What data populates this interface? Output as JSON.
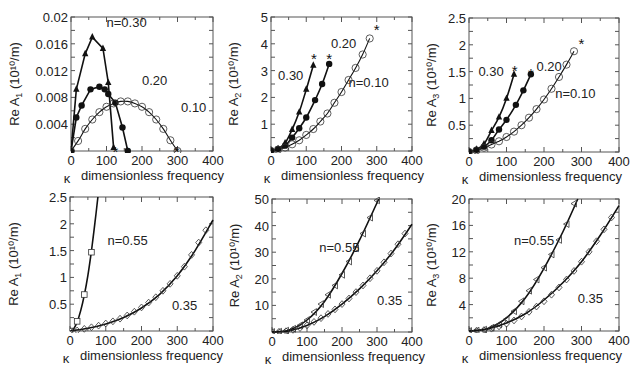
{
  "figure": {
    "xlabel": "dimensionless frequency",
    "kappa_symbol": "κ",
    "y_unit": "(10¹⁰/m)"
  },
  "chart_data": [
    {
      "type": "line",
      "panel": "top-left",
      "ylabel": "Re A1 (10^10/m)",
      "ylabel_main": "Re A",
      "ylabel_sub": "1",
      "xlabel": "κ dimensionless frequency",
      "xlim": [
        0,
        400
      ],
      "ylim": [
        0,
        0.02
      ],
      "xticks": [
        0,
        100,
        200,
        300,
        400
      ],
      "yticks": [
        0.004,
        0.008,
        0.012,
        0.016,
        0.02
      ],
      "ytick_labels": [
        "0.004",
        "0.008",
        "0.012",
        "0.016",
        "0.02"
      ],
      "series": [
        {
          "name": "n=0.30",
          "marker": "filled-triangle",
          "x": [
            0,
            15,
            40,
            60,
            90,
            105,
            120
          ],
          "y": [
            0,
            0.0092,
            0.0145,
            0.017,
            0.0153,
            0.0102,
            0.0005
          ],
          "end_marker": "asterisk",
          "end_x": 125
        },
        {
          "name": "0.20",
          "marker": "filled-circle",
          "x": [
            0,
            15,
            30,
            55,
            80,
            95,
            105,
            125,
            145,
            160
          ],
          "y": [
            0,
            0.005,
            0.0068,
            0.0092,
            0.0096,
            0.0092,
            0.0085,
            0.0072,
            0.0035,
            0
          ],
          "end_marker": "asterisk",
          "end_x": 158
        },
        {
          "name": "0.10",
          "marker": "open-circle",
          "x": [
            0,
            20,
            40,
            60,
            80,
            100,
            120,
            140,
            160,
            180,
            200,
            220,
            240,
            260,
            280,
            300
          ],
          "y": [
            0,
            0.0015,
            0.0033,
            0.0047,
            0.0058,
            0.0066,
            0.0071,
            0.0074,
            0.0074,
            0.0071,
            0.0066,
            0.0058,
            0.0047,
            0.0033,
            0.0016,
            0
          ],
          "end_marker": "asterisk",
          "end_x": 298
        }
      ],
      "annotations": [
        {
          "text": "n=0.30",
          "x": 100,
          "y": 0.0185
        },
        {
          "text": "0.20",
          "x": 200,
          "y": 0.0098
        },
        {
          "text": "0.10",
          "x": 310,
          "y": 0.0058
        }
      ]
    },
    {
      "type": "line",
      "panel": "top-middle",
      "ylabel": "Re A2 (10^10/m)",
      "ylabel_main": "Re A",
      "ylabel_sub": "2",
      "xlabel": "κ dimensionless frequency",
      "xlim": [
        0,
        400
      ],
      "ylim": [
        0,
        5
      ],
      "xticks": [
        0,
        100,
        200,
        300,
        400
      ],
      "yticks": [
        1,
        2,
        3,
        4,
        5
      ],
      "ytick_labels": [
        "1",
        "2",
        "3",
        "4",
        "5"
      ],
      "series": [
        {
          "name": "0.30",
          "marker": "filled-triangle",
          "x": [
            0,
            20,
            40,
            60,
            80,
            100,
            120
          ],
          "y": [
            0.02,
            0.08,
            0.3,
            0.8,
            1.45,
            2.3,
            3.2
          ],
          "end_marker": "asterisk",
          "end_x": 122,
          "end_y": 3.5
        },
        {
          "name": "0.20",
          "marker": "filled-circle",
          "x": [
            0,
            20,
            40,
            60,
            80,
            100,
            125,
            145,
            165
          ],
          "y": [
            0.02,
            0.08,
            0.2,
            0.5,
            0.85,
            1.25,
            1.9,
            2.5,
            3.25
          ],
          "end_marker": "asterisk",
          "end_x": 165,
          "end_y": 3.5
        },
        {
          "name": "n=0.10",
          "marker": "open-circle",
          "x": [
            0,
            20,
            40,
            60,
            80,
            100,
            120,
            140,
            160,
            180,
            200,
            220,
            240,
            260,
            280
          ],
          "y": [
            0,
            0.05,
            0.13,
            0.25,
            0.4,
            0.6,
            0.82,
            1.1,
            1.4,
            1.8,
            2.2,
            2.65,
            3.1,
            3.6,
            4.2
          ],
          "end_marker": "asterisk",
          "end_x": 300,
          "end_y": 4.6
        }
      ],
      "annotations": [
        {
          "text": "0.20",
          "x": 170,
          "y": 3.85
        },
        {
          "text": "0.30",
          "x": 20,
          "y": 2.65
        },
        {
          "text": "n=0.10",
          "x": 220,
          "y": 2.4
        }
      ]
    },
    {
      "type": "line",
      "panel": "top-right",
      "ylabel": "Re A3 (10^10/m)",
      "ylabel_main": "Re A",
      "ylabel_sub": "3",
      "xlabel": "κ dimensionless frequency",
      "xlim": [
        0,
        400
      ],
      "ylim": [
        0,
        2.5
      ],
      "xticks": [
        0,
        100,
        200,
        300,
        400
      ],
      "yticks": [
        0.5,
        1,
        1.5,
        2,
        2.5
      ],
      "ytick_labels": [
        "0.5",
        "1",
        "1.5",
        "2",
        "2.5"
      ],
      "series": [
        {
          "name": "0.30",
          "marker": "filled-triangle",
          "x": [
            0,
            20,
            40,
            60,
            80,
            100,
            120
          ],
          "y": [
            0.01,
            0.05,
            0.15,
            0.4,
            0.65,
            1.0,
            1.45
          ],
          "end_marker": "asterisk",
          "end_x": 122,
          "end_y": 1.55
        },
        {
          "name": "0.20",
          "marker": "filled-circle",
          "x": [
            0,
            20,
            40,
            60,
            80,
            100,
            125,
            145,
            165
          ],
          "y": [
            0.01,
            0.04,
            0.1,
            0.22,
            0.42,
            0.6,
            0.88,
            1.15,
            1.45
          ],
          "end_marker": "asterisk",
          "end_x": 165,
          "end_y": 1.5
        },
        {
          "name": "n=0.10",
          "marker": "open-circle",
          "x": [
            0,
            20,
            40,
            60,
            80,
            100,
            120,
            140,
            160,
            180,
            200,
            220,
            240,
            260,
            280
          ],
          "y": [
            0,
            0.03,
            0.08,
            0.14,
            0.2,
            0.28,
            0.38,
            0.5,
            0.64,
            0.8,
            0.98,
            1.18,
            1.4,
            1.63,
            1.88
          ],
          "end_marker": "asterisk",
          "end_x": 300,
          "end_y": 2.05
        }
      ],
      "annotations": [
        {
          "text": "0.30",
          "x": 25,
          "y": 1.42
        },
        {
          "text": "0.20",
          "x": 180,
          "y": 1.52
        },
        {
          "text": "n=0.10",
          "x": 230,
          "y": 1.0
        }
      ]
    },
    {
      "type": "line",
      "panel": "bottom-left",
      "ylabel": "Re A1 (10^10/m)",
      "ylabel_main": "Re A",
      "ylabel_sub": "1",
      "xlabel": "κ dimensionless frequency",
      "xlim": [
        0,
        400
      ],
      "ylim": [
        0,
        2.5
      ],
      "xticks": [
        0,
        100,
        200,
        300,
        400
      ],
      "yticks": [
        0.5,
        1,
        1.5,
        2,
        2.5
      ],
      "ytick_labels": [
        "0.5",
        "1",
        "1.5",
        "2",
        "2.5"
      ],
      "series": [
        {
          "name": "n=0.55",
          "marker": "open-square",
          "x": [
            0,
            20,
            40,
            60
          ],
          "y": [
            0,
            0.18,
            0.68,
            1.47
          ],
          "curve_x": [
            0,
            10,
            20,
            30,
            40,
            50,
            60,
            70,
            78
          ],
          "curve_y": [
            0,
            0.04,
            0.17,
            0.38,
            0.67,
            1.04,
            1.5,
            2.03,
            2.5
          ]
        },
        {
          "name": "0.35",
          "marker": "open-diamond",
          "x": [
            0,
            20,
            40,
            60,
            80,
            100,
            120,
            140,
            160,
            180,
            200,
            220,
            240,
            260,
            280,
            300,
            320,
            340,
            360,
            380
          ],
          "y": [
            0,
            0.01,
            0.04,
            0.07,
            0.1,
            0.14,
            0.18,
            0.23,
            0.29,
            0.36,
            0.44,
            0.53,
            0.63,
            0.75,
            0.88,
            1.03,
            1.2,
            1.42,
            1.65,
            1.88
          ],
          "curve_x": [
            0,
            50,
            100,
            150,
            200,
            250,
            300,
            350,
            400
          ],
          "curve_y": [
            0,
            0.05,
            0.13,
            0.25,
            0.43,
            0.68,
            1.03,
            1.5,
            2.07
          ]
        }
      ],
      "annotations": [
        {
          "text": "n=0.55",
          "x": 105,
          "y": 1.6
        },
        {
          "text": "0.35",
          "x": 285,
          "y": 0.4
        }
      ]
    },
    {
      "type": "line",
      "panel": "bottom-middle",
      "ylabel": "Re A2 (10^10/m)",
      "ylabel_main": "Re A",
      "ylabel_sub": "2",
      "xlabel": "κ dimensionless frequency",
      "xlim": [
        0,
        400
      ],
      "ylim": [
        0,
        50
      ],
      "xticks": [
        0,
        100,
        200,
        300,
        400
      ],
      "yticks": [
        10,
        20,
        30,
        40,
        50
      ],
      "ytick_labels": [
        "10",
        "20",
        "30",
        "40",
        "50"
      ],
      "series": [
        {
          "name": "n=0.55",
          "marker": "open-left-triangle",
          "x": [
            0,
            20,
            40,
            60,
            80,
            100,
            120,
            140,
            160,
            180,
            200,
            220,
            240,
            260,
            280,
            300
          ],
          "y": [
            0,
            0.1,
            0.5,
            1.2,
            2.5,
            4.5,
            7.5,
            10.5,
            14,
            17.5,
            21.5,
            26.5,
            31.5,
            37,
            43,
            49.5
          ],
          "curve_x": [
            0,
            50,
            100,
            150,
            200,
            250,
            305
          ],
          "curve_y": [
            0,
            0.8,
            4.5,
            11.5,
            22,
            34.5,
            50
          ]
        },
        {
          "name": "0.35",
          "marker": "open-diamond",
          "x": [
            0,
            20,
            40,
            60,
            80,
            100,
            120,
            140,
            160,
            180,
            200,
            220,
            240,
            260,
            280,
            300,
            320,
            340,
            360,
            380
          ],
          "y": [
            0,
            0.1,
            0.3,
            0.8,
            1.5,
            2.5,
            3.8,
            5.2,
            6.8,
            8.5,
            10.5,
            12.6,
            15,
            17.5,
            20.2,
            23,
            26.2,
            29.5,
            33,
            37
          ],
          "curve_x": [
            0,
            50,
            100,
            150,
            200,
            250,
            300,
            350,
            400
          ],
          "curve_y": [
            0,
            0.5,
            2.5,
            5.8,
            10.5,
            16.2,
            23,
            31,
            40.5
          ]
        }
      ],
      "annotations": [
        {
          "text": "n=0.55",
          "x": 135,
          "y": 30
        },
        {
          "text": "0.35",
          "x": 300,
          "y": 10
        }
      ]
    },
    {
      "type": "line",
      "panel": "bottom-right",
      "ylabel": "Re A3 (10^10/m)",
      "ylabel_main": "Re A",
      "ylabel_sub": "3",
      "xlabel": "κ dimensionless frequency",
      "xlim": [
        0,
        400
      ],
      "ylim": [
        0,
        20
      ],
      "xticks": [
        0,
        100,
        200,
        300,
        400
      ],
      "yticks": [
        4,
        8,
        12,
        16,
        20
      ],
      "ytick_labels": [
        "4",
        "8",
        "12",
        "16",
        "20"
      ],
      "series": [
        {
          "name": "n=0.55",
          "marker": "open-left-triangle",
          "x": [
            0,
            20,
            40,
            60,
            80,
            100,
            120,
            140,
            160,
            180,
            200,
            220,
            240,
            260,
            280
          ],
          "y": [
            0,
            0.05,
            0.2,
            0.5,
            1.0,
            1.8,
            3.0,
            4.5,
            6.1,
            7.8,
            9.6,
            11.6,
            13.8,
            16.2,
            19.3
          ],
          "curve_x": [
            0,
            50,
            100,
            150,
            200,
            250,
            290
          ],
          "curve_y": [
            0,
            0.4,
            2.0,
            5.0,
            9.5,
            15,
            20
          ]
        },
        {
          "name": "0.35",
          "marker": "open-diamond",
          "x": [
            0,
            20,
            40,
            60,
            80,
            100,
            120,
            140,
            160,
            180,
            200,
            220,
            240,
            260,
            280,
            300,
            320,
            340,
            360,
            380
          ],
          "y": [
            0,
            0.05,
            0.15,
            0.35,
            0.7,
            1.1,
            1.6,
            2.2,
            2.9,
            3.7,
            4.5,
            5.5,
            6.6,
            7.8,
            9.1,
            10.5,
            12,
            13.6,
            15.4,
            17.2
          ],
          "curve_x": [
            0,
            50,
            100,
            150,
            200,
            250,
            300,
            350,
            400
          ],
          "curve_y": [
            0,
            0.3,
            1.2,
            2.6,
            4.7,
            7.3,
            10.5,
            14.5,
            19
          ]
        }
      ],
      "annotations": [
        {
          "text": "n=0.55",
          "x": 120,
          "y": 13
        },
        {
          "text": "0.35",
          "x": 290,
          "y": 4.2
        }
      ]
    }
  ],
  "layout": {
    "panels": [
      {
        "left": 71,
        "top": 17,
        "right": 213,
        "bottom": 151
      },
      {
        "left": 271,
        "top": 17,
        "right": 412,
        "bottom": 151
      },
      {
        "left": 469,
        "top": 18,
        "right": 619,
        "bottom": 152
      },
      {
        "left": 70,
        "top": 197,
        "right": 213,
        "bottom": 331
      },
      {
        "left": 272,
        "top": 199,
        "right": 412,
        "bottom": 332
      },
      {
        "left": 469,
        "top": 199,
        "right": 619,
        "bottom": 331
      }
    ]
  }
}
